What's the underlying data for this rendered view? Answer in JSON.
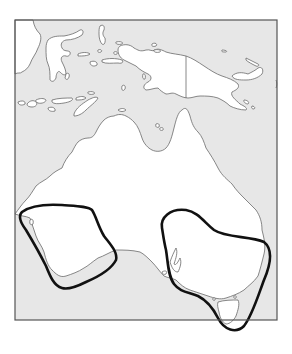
{
  "map": {
    "title": "",
    "subject": "Australia with two highlighted distribution regions",
    "colors": {
      "sea": "#e7e7e7",
      "land": "#ffffff",
      "coastline": "#6a6a6a",
      "frame": "#555555",
      "region_outline": "#111111"
    },
    "landmasses": [
      {
        "name": "Australia"
      },
      {
        "name": "Tasmania"
      },
      {
        "name": "New Guinea"
      },
      {
        "name": "Sulawesi"
      },
      {
        "name": "Lesser Sunda Islands"
      },
      {
        "name": "Maluku Islands"
      },
      {
        "name": "New Britain"
      }
    ],
    "highlighted_regions": [
      {
        "name": "southwest-western-australia"
      },
      {
        "name": "southeast-australia-and-tasmania"
      }
    ],
    "labels": []
  }
}
